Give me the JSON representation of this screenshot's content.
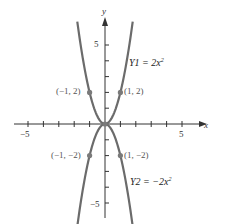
{
  "chart_data": {
    "type": "line",
    "title": "",
    "xlabel": "x",
    "ylabel": "y",
    "xlim": [
      -5.5,
      6
    ],
    "ylim": [
      -6,
      6
    ],
    "grid": false,
    "x_tick_labels": [
      {
        "value": -5,
        "label": "−5"
      },
      {
        "value": 5,
        "label": "5"
      }
    ],
    "y_tick_labels": [
      {
        "value": 5,
        "label": "5"
      },
      {
        "value": -5,
        "label": "−5"
      }
    ],
    "x_ticks": [
      -5,
      -4,
      -3,
      -2,
      -1,
      1,
      2,
      3,
      4,
      5
    ],
    "y_ticks": [
      -5,
      -4,
      -3,
      -2,
      -1,
      1,
      2,
      3,
      4,
      5
    ],
    "series": [
      {
        "name": "Y1 = 2x²",
        "label_main": "Y1 = 2x",
        "label_exp": "2",
        "formula": "2x^2",
        "coef": 2,
        "color": "#6b6b6b"
      },
      {
        "name": "Y2 = −2x²",
        "label_main": "Y2 = −2x",
        "label_exp": "2",
        "formula": "-2x^2",
        "coef": -2,
        "color": "#6b6b6b"
      }
    ],
    "points": [
      {
        "x": -1,
        "y": 2,
        "label": "(−1, 2)"
      },
      {
        "x": 1,
        "y": 2,
        "label": "(1, 2)"
      },
      {
        "x": -1,
        "y": -2,
        "label": "(−1, −2)"
      },
      {
        "x": 1,
        "y": -2,
        "label": "(1, −2)"
      },
      {
        "x": 0,
        "y": 0,
        "label": ""
      }
    ]
  },
  "axes": {
    "x_name": "x",
    "y_name": "y"
  },
  "colors": {
    "curve": "#6b6b6b",
    "axis": "#333333",
    "point": "#7a7a7a"
  }
}
